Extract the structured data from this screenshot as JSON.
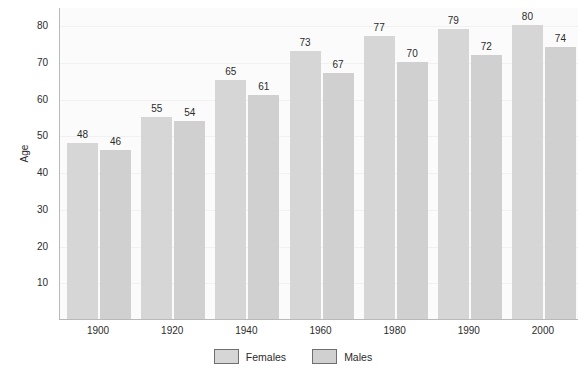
{
  "chart_data": {
    "type": "bar",
    "title": "",
    "subtitle": "",
    "xlabel": "",
    "ylabel": "Age",
    "categories": [
      "1900",
      "1920",
      "1940",
      "1960",
      "1980",
      "1990",
      "2000"
    ],
    "series": [
      {
        "name": "Females",
        "values": [
          48,
          55,
          65,
          73,
          77,
          79,
          80
        ],
        "color": "#d6d6d6"
      },
      {
        "name": "Males",
        "values": [
          46,
          54,
          61,
          67,
          70,
          72,
          74
        ],
        "color": "#d0d0d0"
      }
    ],
    "ylim": [
      0,
      85
    ],
    "yticks": [
      10,
      20,
      30,
      40,
      50,
      60,
      70,
      80
    ],
    "grid": true,
    "data_labels": true,
    "legend_position": "bottom-center",
    "legend_entries": [
      "Females",
      "Males"
    ],
    "background_color": "#ffffff",
    "plot_background_color": "#fbfbfb",
    "axis_color": "#b9b9b9",
    "text_color": "#2b2b2b"
  }
}
